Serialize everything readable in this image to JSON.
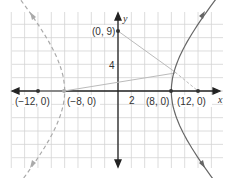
{
  "chart_data": {
    "type": "line",
    "title": "",
    "xlabel": "x",
    "ylabel": "y",
    "xlim": [
      -16,
      15.75
    ],
    "ylim": [
      -11.5,
      11.8
    ],
    "grid": true,
    "grid_step": 2,
    "tick_labels": {
      "x": [
        "2"
      ],
      "y": [
        "4"
      ]
    },
    "curves": [
      {
        "name": "hyperbola right branch",
        "equation": "x^2/64 - y^2/80 = 1",
        "style": "solid",
        "vertex": [
          8,
          0
        ]
      },
      {
        "name": "hyperbola left branch",
        "equation": "x^2/64 - y^2/80 = 1",
        "style": "dashed",
        "vertex": [
          -8,
          0
        ]
      }
    ],
    "segments": [
      {
        "from": [
          0,
          9
        ],
        "to": [
          12,
          0
        ],
        "style": "solid then dashed"
      },
      {
        "from": [
          -8,
          0
        ],
        "to": [
          8.6,
          2.6
        ],
        "style": "solid"
      }
    ],
    "points": [
      {
        "label": "(−12, 0)",
        "x": -12,
        "y": 0
      },
      {
        "label": "(−8, 0)",
        "x": -8,
        "y": 0
      },
      {
        "label": "(8, 0)",
        "x": 8,
        "y": 0
      },
      {
        "label": "(12, 0)",
        "x": 12,
        "y": 0
      },
      {
        "label": "(0, 9)",
        "x": 0,
        "y": 9
      }
    ],
    "colors": {
      "curve": "#666666",
      "dashed": "#aaaaaa",
      "segment": "#bbbbbb",
      "axis": "#222222",
      "grid": "#d0d0d0"
    }
  },
  "labels": {
    "x_axis": "x",
    "y_axis": "y",
    "tick_x": "2",
    "tick_y": "4",
    "p_neg12": "(−12, 0)",
    "p_neg8": "(−8, 0)",
    "p_8": "(8, 0)",
    "p_12": "(12, 0)",
    "p_09": "(0, 9)"
  }
}
